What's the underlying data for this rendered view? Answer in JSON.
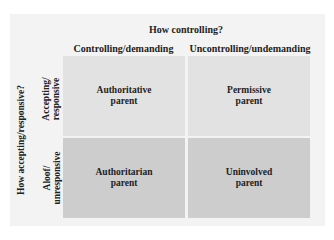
{
  "diagram": {
    "title": "How controlling?",
    "row_axis_label": "How accepting/responsive?",
    "columns": [
      "Controlling/demanding",
      "Uncontrolling/undemanding"
    ],
    "rows": [
      "Accepting/\nresponsive",
      "Aloof/\nunresponsive"
    ],
    "cells": [
      [
        "Authoritative\nparent",
        "Permissive\nparent"
      ],
      [
        "Authoritarian\nparent",
        "Uninvolved\nparent"
      ]
    ],
    "colors": {
      "panel": "#f3f3f3",
      "top_row": "#e2e2e2",
      "bottom_row": "#cdcdcd",
      "text": "#222222"
    }
  }
}
